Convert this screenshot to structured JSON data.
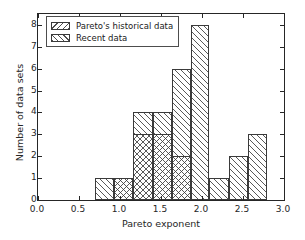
{
  "chart_data": {
    "type": "bar",
    "title": "",
    "xlabel": "Pareto exponent",
    "ylabel": "Number of data sets",
    "xlim": [
      0.0,
      3.0
    ],
    "ylim": [
      0,
      8.5
    ],
    "grid": false,
    "legend_position": "upper left",
    "xticks": [
      "0.0",
      "0.5",
      "1.0",
      "1.5",
      "2.0",
      "2.5",
      "3.0"
    ],
    "xtick_values": [
      0.0,
      0.5,
      1.0,
      1.5,
      2.0,
      2.5,
      3.0
    ],
    "yticks": [
      "0",
      "1",
      "2",
      "3",
      "4",
      "5",
      "6",
      "7",
      "8"
    ],
    "ytick_values": [
      0,
      1,
      2,
      3,
      4,
      5,
      6,
      7,
      8
    ],
    "bin_edges": [
      0.7,
      0.93,
      1.16,
      1.4,
      1.63,
      1.86,
      2.09,
      2.33,
      2.56,
      2.79
    ],
    "series": [
      {
        "name": "Pareto's historical data",
        "hatch": "backslash",
        "values": [
          0,
          1,
          3,
          3,
          2,
          0,
          0,
          0,
          0
        ]
      },
      {
        "name": "Recent data",
        "hatch": "slash",
        "values": [
          1,
          1,
          4,
          4,
          6,
          8,
          1,
          2,
          3
        ]
      }
    ]
  },
  "legend": {
    "entries": [
      {
        "label": "Pareto's historical data"
      },
      {
        "label": "Recent data"
      }
    ]
  },
  "colors": {
    "frame": "#262626",
    "bar_edge": "#3a3a3a",
    "hatch": "#3c3c3c",
    "background": "#ffffff",
    "text": "#262626"
  }
}
